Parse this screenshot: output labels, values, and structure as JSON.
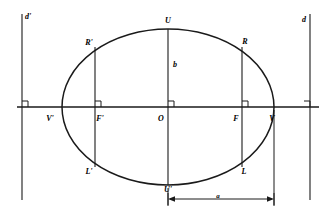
{
  "figure": {
    "background_color": "#ffffff",
    "stroke_color": "#1a1a1a",
    "width": 336,
    "height": 217
  },
  "geometry": {
    "center": {
      "x": 168,
      "y": 107
    },
    "semi_major_a": 106,
    "semi_minor_b": 78,
    "focus_offset_c": 74,
    "directrix_left_x": 22,
    "directrix_right_x": 310,
    "axis_y": 107,
    "dimension_line_y": 199
  },
  "labels": {
    "directrix_left": {
      "text": "d'",
      "x": 28,
      "y": 17
    },
    "directrix_right": {
      "text": "d",
      "x": 304,
      "y": 20
    },
    "vertex_top": {
      "text": "U",
      "x": 168,
      "y": 21
    },
    "vertex_bottom": {
      "text": "U'",
      "x": 168,
      "y": 190
    },
    "vertex_left": {
      "text": "V'",
      "x": 50,
      "y": 119
    },
    "vertex_right": {
      "text": "V",
      "x": 272,
      "y": 119
    },
    "focus_left": {
      "text": "F'",
      "x": 100,
      "y": 119
    },
    "focus_right": {
      "text": "F",
      "x": 236,
      "y": 119
    },
    "center": {
      "text": "O",
      "x": 161,
      "y": 119
    },
    "latus_right_top": {
      "text": "R",
      "x": 245,
      "y": 42
    },
    "latus_right_bottom": {
      "text": "L",
      "x": 244,
      "y": 172
    },
    "latus_left_top": {
      "text": "R'",
      "x": 89,
      "y": 43
    },
    "latus_left_bottom": {
      "text": "L'",
      "x": 89,
      "y": 172
    },
    "semi_minor": {
      "text": "b",
      "x": 175,
      "y": 65
    },
    "semi_major_dimension": {
      "text": "a",
      "x": 218,
      "y": 196
    }
  },
  "elements": {
    "ellipse_name": "ellipse-curve",
    "major_axis_name": "major-axis-line",
    "minor_axis_name": "minor-axis-line",
    "latus_rectum_left_name": "latus-rectum-left",
    "latus_rectum_right_name": "latus-rectum-right",
    "dimension_name": "semi-major-dimension-line"
  }
}
